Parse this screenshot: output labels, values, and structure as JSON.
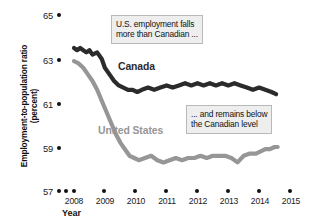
{
  "chart_data": {
    "type": "line",
    "title": "",
    "subtitle": "",
    "xlabel": "Year",
    "ylabel": "Employment-to-population ratio (percent)",
    "xlim": [
      2007.75,
      2015.25
    ],
    "ylim": [
      57,
      65
    ],
    "xticks": [
      "2008",
      "2009",
      "2010",
      "2011",
      "2012",
      "2013",
      "2014",
      "2015"
    ],
    "yticks": [
      "57",
      "59",
      "61",
      "63",
      "65"
    ],
    "grid": false,
    "legend_position": "inline-labels",
    "series": [
      {
        "name": "Canada",
        "color": "#2b2b2b",
        "x": [
          2008.0,
          2008.1,
          2008.2,
          2008.3,
          2008.4,
          2008.5,
          2008.6,
          2008.75,
          2008.9,
          2009.0,
          2009.15,
          2009.3,
          2009.45,
          2009.6,
          2009.75,
          2009.9,
          2010.05,
          2010.2,
          2010.4,
          2010.6,
          2010.8,
          2011.0,
          2011.2,
          2011.4,
          2011.6,
          2011.8,
          2012.0,
          2012.2,
          2012.4,
          2012.6,
          2012.8,
          2013.0,
          2013.2,
          2013.4,
          2013.6,
          2013.8,
          2014.0,
          2014.2,
          2014.4,
          2014.55
        ],
        "y": [
          63.5,
          63.4,
          63.5,
          63.4,
          63.3,
          63.4,
          63.2,
          63.3,
          63.0,
          62.6,
          62.3,
          62.0,
          61.8,
          61.7,
          61.6,
          61.6,
          61.5,
          61.6,
          61.7,
          61.6,
          61.7,
          61.8,
          61.7,
          61.8,
          61.9,
          61.8,
          61.9,
          61.8,
          61.9,
          61.8,
          61.9,
          61.8,
          61.9,
          61.8,
          61.7,
          61.6,
          61.7,
          61.6,
          61.5,
          61.4
        ]
      },
      {
        "name": "United States",
        "color": "#969696",
        "x": [
          2008.0,
          2008.15,
          2008.3,
          2008.45,
          2008.6,
          2008.75,
          2008.9,
          2009.05,
          2009.2,
          2009.35,
          2009.5,
          2009.65,
          2009.8,
          2009.95,
          2010.1,
          2010.3,
          2010.5,
          2010.7,
          2010.9,
          2011.1,
          2011.3,
          2011.5,
          2011.7,
          2011.9,
          2012.1,
          2012.3,
          2012.5,
          2012.7,
          2012.9,
          2013.1,
          2013.3,
          2013.5,
          2013.7,
          2013.9,
          2014.05,
          2014.2,
          2014.35,
          2014.5,
          2014.6
        ],
        "y": [
          62.9,
          62.8,
          62.6,
          62.3,
          62.0,
          61.6,
          61.1,
          60.6,
          60.1,
          59.6,
          59.2,
          58.9,
          58.6,
          58.5,
          58.4,
          58.5,
          58.6,
          58.4,
          58.3,
          58.4,
          58.5,
          58.4,
          58.5,
          58.5,
          58.6,
          58.5,
          58.6,
          58.6,
          58.6,
          58.5,
          58.3,
          58.6,
          58.7,
          58.7,
          58.8,
          58.9,
          58.9,
          59.0,
          59.0
        ]
      }
    ],
    "annotations": [
      {
        "id": "annotation-us-falls",
        "line1": "U.S. employment falls",
        "line2": "more than Canadian ..."
      },
      {
        "id": "annotation-remains-below",
        "line1": "... and remains below",
        "line2": "the Canadian level"
      }
    ]
  },
  "colors": {
    "canada": "#2b2b2b",
    "united_states": "#969696",
    "annotation_bg": "#eeeeee",
    "annotation_border": "#b9b9b9",
    "axis_text": "#1a1a1a"
  }
}
